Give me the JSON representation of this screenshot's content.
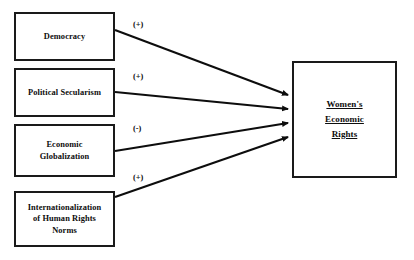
{
  "diagram": {
    "type": "path-diagram",
    "background_color": "#ffffff",
    "line_color": "#0d0d0d",
    "predictors": [
      {
        "id": "democracy",
        "label": "Democracy",
        "effect_sign": "(+)",
        "box": {
          "x": 14,
          "y": 12,
          "width": 101,
          "height": 49
        }
      },
      {
        "id": "political-secularism",
        "label": "Political Secularism",
        "effect_sign": "(+)",
        "box": {
          "x": 14,
          "y": 68,
          "width": 101,
          "height": 49
        }
      },
      {
        "id": "economic-globalization",
        "label": "Economic\nGlobalization",
        "effect_sign": "(-)",
        "box": {
          "x": 14,
          "y": 124,
          "width": 101,
          "height": 53
        }
      },
      {
        "id": "internationalization-human-rights-norms",
        "label": "Internationalization\nof Human Rights\nNorms",
        "effect_sign": "(+)",
        "box": {
          "x": 14,
          "y": 191,
          "width": 101,
          "height": 56
        }
      }
    ],
    "outcome": {
      "id": "womens-economic-rights",
      "label": "Women's\nEconomic\nRights",
      "underlined": true,
      "box": {
        "x": 292,
        "y": 61,
        "width": 105,
        "height": 117
      }
    },
    "arrows": [
      {
        "from": "democracy",
        "to": "womens-economic-rights",
        "sign": "(+)",
        "x1": 115,
        "y1": 30,
        "x2": 290,
        "y2": 95
      },
      {
        "from": "political-secularism",
        "to": "womens-economic-rights",
        "sign": "(+)",
        "x1": 115,
        "y1": 92,
        "x2": 290,
        "y2": 109
      },
      {
        "from": "economic-globalization",
        "to": "womens-economic-rights",
        "sign": "(-)",
        "x1": 115,
        "y1": 151,
        "x2": 290,
        "y2": 123
      },
      {
        "from": "internationalization-human-rights-norms",
        "to": "womens-economic-rights",
        "sign": "(+)",
        "x1": 115,
        "y1": 197,
        "x2": 290,
        "y2": 137
      }
    ]
  }
}
